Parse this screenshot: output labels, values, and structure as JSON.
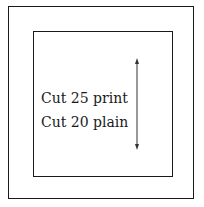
{
  "diagram": {
    "outer_box": {
      "label": ""
    },
    "inner_box": {
      "lines": [
        "Cut 25 print",
        "Cut 20 plain"
      ]
    },
    "arrow": {
      "direction": "vertical-double",
      "icon": "double-arrow-vertical-icon"
    }
  }
}
